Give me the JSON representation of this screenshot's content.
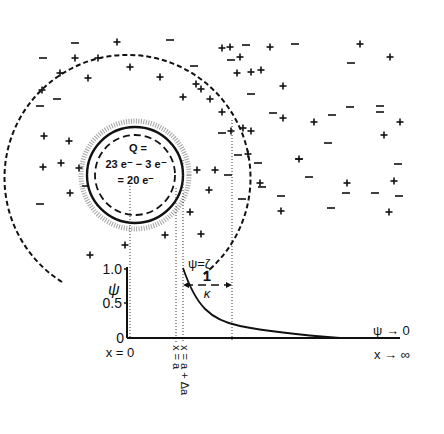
{
  "particle": {
    "charge_label": "Q =",
    "charge_line1": "23 e⁻ − 3 e⁻",
    "charge_line2": "= 20 e⁻",
    "center": [
      135,
      175
    ],
    "solid_radius": 48,
    "dashed_radius": 40,
    "halo_radius": 54
  },
  "double_layer": {
    "outer_radius": 123
  },
  "ions": {
    "plus": [
      [
        117,
        42
      ],
      [
        75,
        58
      ],
      [
        98,
        58
      ],
      [
        60,
        73
      ],
      [
        88,
        78
      ],
      [
        130,
        67
      ],
      [
        160,
        77
      ],
      [
        42,
        90
      ],
      [
        196,
        84
      ],
      [
        183,
        97
      ],
      [
        210,
        99
      ],
      [
        222,
        48
      ],
      [
        230,
        47
      ],
      [
        270,
        47
      ],
      [
        251,
        72
      ],
      [
        261,
        70
      ],
      [
        237,
        73
      ],
      [
        240,
        57
      ],
      [
        360,
        44
      ],
      [
        390,
        57
      ],
      [
        283,
        86
      ],
      [
        283,
        118
      ],
      [
        222,
        112
      ],
      [
        201,
        89
      ],
      [
        231,
        131
      ],
      [
        251,
        131
      ],
      [
        248,
        154
      ],
      [
        215,
        170
      ],
      [
        209,
        190
      ],
      [
        190,
        212
      ],
      [
        197,
        170
      ],
      [
        44,
        136
      ],
      [
        69,
        141
      ],
      [
        43,
        167
      ],
      [
        61,
        163
      ],
      [
        79,
        168
      ],
      [
        70,
        193
      ],
      [
        100,
        205
      ],
      [
        90,
        255
      ],
      [
        125,
        245
      ],
      [
        165,
        235
      ],
      [
        201,
        234
      ],
      [
        314,
        122
      ],
      [
        400,
        122
      ],
      [
        384,
        135
      ],
      [
        243,
        128
      ],
      [
        299,
        159
      ],
      [
        260,
        183
      ],
      [
        347,
        183
      ],
      [
        394,
        181
      ],
      [
        281,
        211
      ],
      [
        389,
        212
      ]
    ],
    "minus": [
      [
        75,
        43
      ],
      [
        43,
        58
      ],
      [
        170,
        40
      ],
      [
        194,
        66
      ],
      [
        246,
        45
      ],
      [
        295,
        44
      ],
      [
        351,
        63
      ],
      [
        251,
        94
      ],
      [
        231,
        60
      ],
      [
        350,
        107
      ],
      [
        380,
        106
      ],
      [
        380,
        112
      ],
      [
        273,
        113
      ],
      [
        332,
        115
      ],
      [
        328,
        143
      ],
      [
        299,
        159
      ],
      [
        258,
        163
      ],
      [
        398,
        164
      ],
      [
        309,
        177
      ],
      [
        399,
        196
      ],
      [
        242,
        199
      ],
      [
        346,
        193
      ],
      [
        375,
        193
      ],
      [
        281,
        196
      ],
      [
        262,
        187
      ],
      [
        331,
        208
      ],
      [
        57,
        99
      ],
      [
        40,
        106
      ],
      [
        40,
        204
      ],
      [
        86,
        186
      ],
      [
        222,
        133
      ],
      [
        238,
        155
      ],
      [
        228,
        175
      ]
    ]
  },
  "graph": {
    "y_axis_label": "ψ",
    "y_ticks": [
      {
        "label": "1.0",
        "value": 1.0
      },
      {
        "label": "0.5",
        "value": 0.5
      },
      {
        "label": "0",
        "value": 0
      }
    ],
    "x_labels": {
      "origin": "x = 0",
      "a": "x = a",
      "a_plus_da": "x = a + Δa"
    },
    "zeta_label": "ψ=ζ",
    "debye_label_num": "1",
    "debye_label_den": "κ",
    "limit_psi": "ψ → 0",
    "limit_x": "x → ∞"
  },
  "chart_data": {
    "type": "line",
    "title": "",
    "xlabel": "x",
    "ylabel": "ψ",
    "ylim": [
      0,
      1.0
    ],
    "y_ticks": [
      0,
      0.5,
      1.0
    ],
    "series": [
      {
        "name": "ψ(x) = ζ exp(−κ(x − a))",
        "x": [
          0,
          0.5,
          1,
          1.5,
          2,
          3,
          4,
          5
        ],
        "values": [
          1.0,
          0.61,
          0.37,
          0.22,
          0.14,
          0.05,
          0.02,
          0.0
        ]
      }
    ],
    "annotations": [
      "ψ=ζ",
      "1/κ",
      "x = 0",
      "x = a",
      "x = a + Δa",
      "ψ → 0",
      "x → ∞"
    ],
    "grid": false
  }
}
